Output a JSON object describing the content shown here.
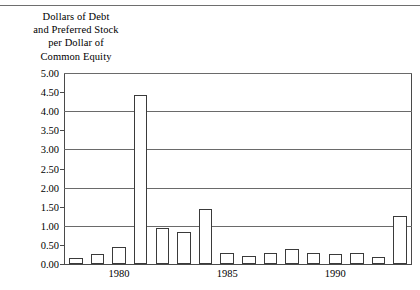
{
  "figure": {
    "title_lines": [
      "Dollars of Debt",
      "and Preferred Stock",
      "per Dollar of",
      "Common Equity"
    ]
  },
  "chart_data": {
    "type": "bar",
    "title": "Dollars of Debt and Preferred Stock per Dollar of Common Equity",
    "xlabel": "",
    "ylabel": "Dollars of Debt and Preferred Stock per Dollar of Common Equity",
    "ylim": [
      0.0,
      5.0
    ],
    "grid": true,
    "legend": null,
    "categories": [
      "1978",
      "1979",
      "1980",
      "1981",
      "1982",
      "1983",
      "1984",
      "1985",
      "1986",
      "1987",
      "1988",
      "1989",
      "1990",
      "1991",
      "1992",
      "1993"
    ],
    "values": [
      0.15,
      0.25,
      0.45,
      4.42,
      0.95,
      0.85,
      1.45,
      0.28,
      0.22,
      0.3,
      0.38,
      0.3,
      0.25,
      0.28,
      0.18,
      1.25
    ],
    "ytick_labels": [
      "0.00",
      "0.50",
      "1.00",
      "1.50",
      "2.00",
      "2.50",
      "3.00",
      "3.50",
      "4.00",
      "4.50",
      "5.00"
    ],
    "ytick_values": [
      0.0,
      0.5,
      1.0,
      1.5,
      2.0,
      2.5,
      3.0,
      3.5,
      4.0,
      4.5,
      5.0
    ],
    "ytick_major": [
      false,
      false,
      true,
      false,
      true,
      false,
      true,
      false,
      true,
      false,
      true
    ],
    "xtick_labels": [
      "1980",
      "1985",
      "1990"
    ],
    "xtick_categories": [
      "1980",
      "1985",
      "1990"
    ],
    "bar_color": "#ffffff",
    "bar_edge_color": "#3a3a3a",
    "axis_color": "#4a4a4a",
    "grid_color": "#6a6a6a"
  }
}
